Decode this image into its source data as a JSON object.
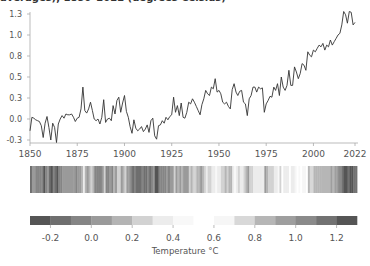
{
  "header": {
    "title": "averages), 1850–2022 (degrees Celsius)"
  },
  "colorbar": {
    "label": "Temperature °C",
    "ticks": [
      "-0.2",
      "0.0",
      "0.2",
      "0.4",
      "0.6",
      "0.8",
      "1.0",
      "1.2"
    ]
  },
  "chart_data": [
    {
      "type": "line",
      "title": "averages), 1850–2022 (degrees Celsius)",
      "xlabel": "",
      "ylabel": "",
      "xlim": [
        1850,
        2022
      ],
      "ylim": [
        -0.3,
        1.3
      ],
      "x_ticks": [
        "1850",
        "1875",
        "1900",
        "1925",
        "1950",
        "1975",
        "2000",
        "2022"
      ],
      "y_ticks": [
        "-0.3",
        "0.0",
        "0.3",
        "0.5",
        "0.8",
        "1.0",
        "1.3"
      ],
      "grid": false,
      "series": [
        {
          "name": "Global temperature anomaly",
          "x_start": 1850,
          "x_end": 2022,
          "values": [
            -0.14,
            0.02,
            0.01,
            -0.01,
            -0.02,
            -0.03,
            -0.08,
            -0.22,
            -0.05,
            0.03,
            -0.1,
            -0.25,
            -0.05,
            -0.1,
            -0.28,
            -0.06,
            0.0,
            0.04,
            0.01,
            0.06,
            0.05,
            0.05,
            0.06,
            0.02,
            -0.03,
            0.01,
            0.02,
            0.12,
            0.38,
            0.1,
            0.07,
            0.12,
            0.2,
            0.1,
            0.0,
            -0.02,
            0.0,
            -0.06,
            0.02,
            0.23,
            -0.04,
            0.0,
            0.01,
            -0.02,
            0.16,
            0.06,
            0.22,
            0.26,
            0.08,
            0.19,
            0.28,
            0.09,
            0.02,
            -0.09,
            -0.17,
            -0.01,
            -0.11,
            -0.14,
            -0.12,
            -0.09,
            -0.15,
            -0.12,
            -0.07,
            -0.16,
            -0.02,
            0.01,
            -0.2,
            -0.24,
            -0.08,
            -0.07,
            -0.02,
            -0.05,
            0.02,
            -0.01,
            0.03,
            0.05,
            0.26,
            0.08,
            0.16,
            0.04,
            0.19,
            0.02,
            0.01,
            0.08,
            0.2,
            0.18,
            0.24,
            0.2,
            0.15,
            0.1,
            0.05,
            0.17,
            0.24,
            0.34,
            0.3,
            0.28,
            0.38,
            0.36,
            0.48,
            0.32,
            0.34,
            0.3,
            0.2,
            0.18,
            0.2,
            0.15,
            0.12,
            0.35,
            0.42,
            0.32,
            0.28,
            0.33,
            0.34,
            0.2,
            0.18,
            0.04,
            0.24,
            0.28,
            0.38,
            0.38,
            0.32,
            0.38,
            0.36,
            0.37,
            0.08,
            0.18,
            0.22,
            0.27,
            0.26,
            0.38,
            0.34,
            0.42,
            0.28,
            0.5,
            0.38,
            0.34,
            0.4,
            0.58,
            0.4,
            0.4,
            0.62,
            0.56,
            0.48,
            0.54,
            0.66,
            0.64,
            0.58,
            0.8,
            0.76,
            0.74,
            0.82,
            0.8,
            0.84,
            0.88,
            0.86,
            0.9,
            0.82,
            0.88,
            0.86,
            0.94,
            0.88,
            0.92,
            0.96,
            1.0,
            1.02,
            1.12,
            1.28,
            1.24,
            1.14,
            1.28,
            1.27,
            1.12,
            1.15
          ]
        }
      ]
    },
    {
      "type": "heatmap",
      "title": "Warming stripes",
      "description": "One vertical stripe per year 1850–2022, shaded by the same anomaly values (grayscale colormap)"
    },
    {
      "type": "colorbar",
      "title": "Temperature °C",
      "range": [
        -0.3,
        1.3
      ],
      "segments": 16,
      "ticks": [
        -0.2,
        0.0,
        0.2,
        0.4,
        0.6,
        0.8,
        1.0,
        1.2
      ],
      "colors": [
        "#555555",
        "#6f6f6f",
        "#858585",
        "#9a9a9a",
        "#b4b4b4",
        "#d2d2d2",
        "#ececec",
        "#f8f8f8",
        "#ffffff",
        "#f6f6f6",
        "#d8d8d8",
        "#b6b6b6",
        "#9e9e9e",
        "#8a8a8a",
        "#727272",
        "#555555"
      ]
    }
  ]
}
